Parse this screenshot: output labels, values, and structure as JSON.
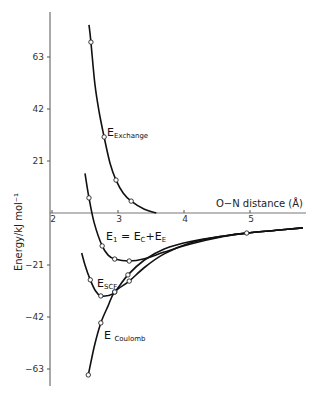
{
  "chart_data": {
    "type": "line",
    "title": "",
    "xlabel": "O−N distance (Å)",
    "ylabel": "Energy/kJ mol⁻¹",
    "xlim": [
      2,
      5.8
    ],
    "ylim": [
      -67,
      78
    ],
    "x_ticks": [
      "2",
      "3",
      "4",
      "5"
    ],
    "y_ticks": [
      "63",
      "42",
      "21",
      "-21",
      "-42",
      "-63"
    ],
    "grid": false,
    "legend": "inline labels",
    "series": [
      {
        "name": "E_Exchange",
        "label_main": "E",
        "label_sub": "Exchange",
        "points": [
          [
            2.59,
            69.0
          ],
          [
            2.79,
            30.7
          ],
          [
            2.97,
            13.3
          ],
          [
            3.2,
            4.8
          ]
        ],
        "curve": [
          [
            2.56,
            76
          ],
          [
            2.59,
            69
          ],
          [
            2.65,
            52
          ],
          [
            2.72,
            40
          ],
          [
            2.79,
            30.7
          ],
          [
            2.88,
            20
          ],
          [
            2.97,
            13.3
          ],
          [
            3.08,
            8
          ],
          [
            3.2,
            4.8
          ],
          [
            3.4,
            1.5
          ],
          [
            3.58,
            0
          ]
        ]
      },
      {
        "name": "E_1 = E_C + E_E",
        "label_main": "E",
        "label_sub": "1",
        "label_rest": " = E",
        "label_sub2": "C",
        "label_rest2": "+E",
        "label_sub3": "E",
        "points": [
          [
            2.56,
            6.1
          ],
          [
            2.76,
            -13.3
          ],
          [
            2.95,
            -18.6
          ],
          [
            3.17,
            -19.4
          ]
        ],
        "curve": [
          [
            2.5,
            16
          ],
          [
            2.56,
            6.1
          ],
          [
            2.64,
            -4
          ],
          [
            2.76,
            -13.3
          ],
          [
            2.85,
            -17
          ],
          [
            2.95,
            -18.6
          ],
          [
            3.17,
            -19.4
          ],
          [
            3.4,
            -18.5
          ],
          [
            3.7,
            -15.8
          ],
          [
            4.1,
            -12.5
          ],
          [
            4.6,
            -9.5
          ],
          [
            4.95,
            -8.1
          ],
          [
            5.4,
            -7
          ],
          [
            5.8,
            -6
          ]
        ]
      },
      {
        "name": "E_SCF",
        "label_main": "E",
        "label_sub": "SCF",
        "points": [
          [
            2.58,
            -27.0
          ],
          [
            2.74,
            -33.5
          ],
          [
            2.95,
            -31.9
          ],
          [
            3.15,
            -25.0
          ]
        ],
        "curve": [
          [
            2.45,
            -16.2
          ],
          [
            2.5,
            -21
          ],
          [
            2.58,
            -27
          ],
          [
            2.66,
            -31.5
          ],
          [
            2.74,
            -33.5
          ],
          [
            2.85,
            -33.3
          ],
          [
            2.95,
            -31.9
          ],
          [
            3.15,
            -25.0
          ],
          [
            3.4,
            -19
          ],
          [
            3.7,
            -14.5
          ],
          [
            4.1,
            -11.5
          ],
          [
            4.6,
            -9.3
          ],
          [
            4.95,
            -8.1
          ],
          [
            5.4,
            -7
          ],
          [
            5.8,
            -6
          ]
        ]
      },
      {
        "name": "E_Coulomb",
        "label_main": "E",
        "label_sub": "Coulomb",
        "points": [
          [
            2.55,
            -65.4
          ],
          [
            2.74,
            -44.4
          ],
          [
            2.95,
            -31.9
          ],
          [
            3.17,
            -27.5
          ],
          [
            4.95,
            -8.1
          ]
        ],
        "curve": [
          [
            2.55,
            -65.4
          ],
          [
            2.64,
            -54
          ],
          [
            2.74,
            -44.4
          ],
          [
            2.85,
            -37.5
          ],
          [
            2.95,
            -31.9
          ],
          [
            3.17,
            -27.5
          ],
          [
            3.4,
            -22
          ],
          [
            3.7,
            -16.5
          ],
          [
            4.1,
            -12
          ],
          [
            4.6,
            -9.3
          ],
          [
            4.95,
            -8.1
          ],
          [
            5.4,
            -7
          ],
          [
            5.8,
            -6
          ]
        ]
      }
    ]
  }
}
